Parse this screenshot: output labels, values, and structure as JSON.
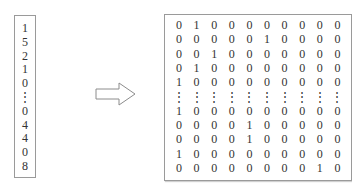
{
  "input_vector": {
    "values": [
      "1",
      "5",
      "2",
      "1",
      "0",
      "⋮",
      "0",
      "4",
      "4",
      "0",
      "8"
    ]
  },
  "arrow": {
    "icon": "hollow-right-arrow-icon",
    "color": "#8c8c8c"
  },
  "one_hot_matrix": {
    "rows": [
      [
        "0",
        "1",
        "0",
        "0",
        "0",
        "0",
        "0",
        "0",
        "0",
        "0"
      ],
      [
        "0",
        "0",
        "0",
        "0",
        "0",
        "1",
        "0",
        "0",
        "0",
        "0"
      ],
      [
        "0",
        "0",
        "1",
        "0",
        "0",
        "0",
        "0",
        "0",
        "0",
        "0"
      ],
      [
        "0",
        "1",
        "0",
        "0",
        "0",
        "0",
        "0",
        "0",
        "0",
        "0"
      ],
      [
        "1",
        "0",
        "0",
        "0",
        "0",
        "0",
        "0",
        "0",
        "0",
        "0"
      ],
      [
        "⋮",
        "⋮",
        "⋮",
        "⋮",
        "⋮",
        "⋮",
        "⋮",
        "⋮",
        "⋮",
        "⋮"
      ],
      [
        "1",
        "0",
        "0",
        "0",
        "0",
        "0",
        "0",
        "0",
        "0",
        "0"
      ],
      [
        "0",
        "0",
        "0",
        "0",
        "1",
        "0",
        "0",
        "0",
        "0",
        "0"
      ],
      [
        "0",
        "0",
        "0",
        "0",
        "1",
        "0",
        "0",
        "0",
        "0",
        "0"
      ],
      [
        "1",
        "0",
        "0",
        "0",
        "0",
        "0",
        "0",
        "0",
        "0",
        "0"
      ],
      [
        "0",
        "0",
        "0",
        "0",
        "0",
        "0",
        "0",
        "0",
        "1",
        "0"
      ]
    ]
  }
}
